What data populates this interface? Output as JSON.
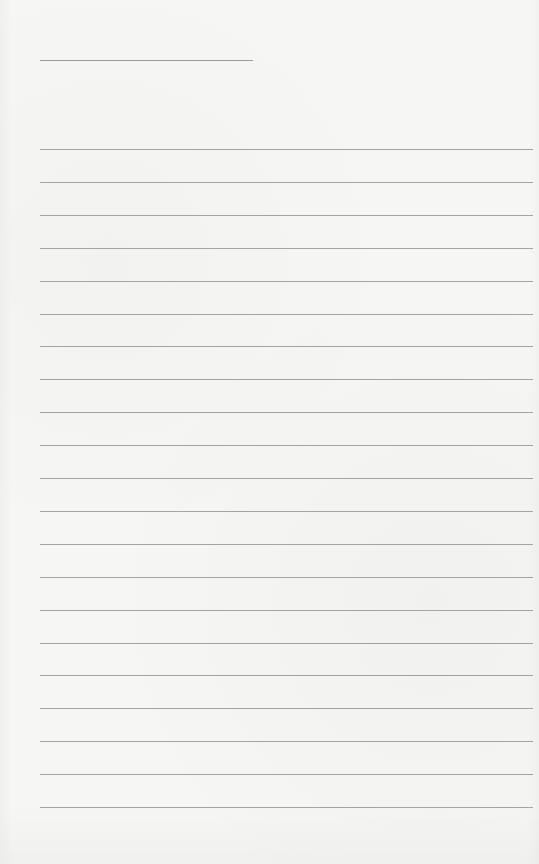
{
  "page": {
    "type": "lined-paper",
    "background_color": "#f6f6f4",
    "line_color": "#a4a4a2"
  },
  "header_line": {
    "x": 40,
    "y": 60,
    "width": 213
  },
  "ruled_lines": {
    "x": 40,
    "width": 493,
    "start_y": 149,
    "spacing": 32.9,
    "count": 21
  }
}
